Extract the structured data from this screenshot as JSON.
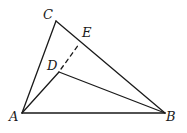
{
  "diagram": {
    "type": "geometry",
    "points": {
      "A": {
        "label": "A",
        "x": 22,
        "y": 113,
        "lx": 9,
        "ly": 121
      },
      "B": {
        "label": "B",
        "x": 165,
        "y": 113,
        "lx": 166,
        "ly": 121
      },
      "C": {
        "label": "C",
        "x": 56,
        "y": 21,
        "lx": 43,
        "ly": 19
      },
      "D": {
        "label": "D",
        "x": 59,
        "y": 72,
        "lx": 47,
        "ly": 70
      },
      "E": {
        "label": "E",
        "x": 80,
        "y": 41,
        "lx": 82,
        "ly": 37
      }
    },
    "segments": [
      {
        "from": "A",
        "to": "B",
        "style": "solid"
      },
      {
        "from": "A",
        "to": "C",
        "style": "solid"
      },
      {
        "from": "C",
        "to": "B",
        "style": "solid"
      },
      {
        "from": "A",
        "to": "D",
        "style": "solid"
      },
      {
        "from": "D",
        "to": "B",
        "style": "solid"
      },
      {
        "from": "D",
        "to": "E",
        "style": "dashed"
      }
    ],
    "stroke_color": "#1a1a1a"
  }
}
